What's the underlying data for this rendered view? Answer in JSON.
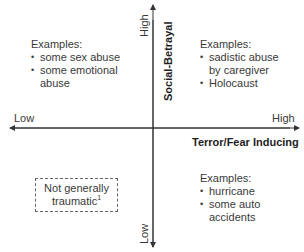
{
  "axes": {
    "vertical": {
      "title": "Social-Betrayal",
      "high_label": "High",
      "low_label": "Low"
    },
    "horizontal": {
      "title": "Terror/Fear Inducing",
      "high_label": "High",
      "low_label": "Low"
    },
    "color": "#333333"
  },
  "quadrants": {
    "top_left": {
      "heading": "Examples:",
      "items": [
        "some sex abuse",
        "some emotional abuse"
      ]
    },
    "top_right": {
      "heading": "Examples:",
      "items": [
        "sadistic abuse by caregiver",
        "Holocaust"
      ]
    },
    "bottom_left": {
      "box_text": "Not generally traumatic",
      "footnote": "1"
    },
    "bottom_right": {
      "heading": "Examples:",
      "items": [
        "hurricane",
        "some auto accidents"
      ]
    }
  }
}
